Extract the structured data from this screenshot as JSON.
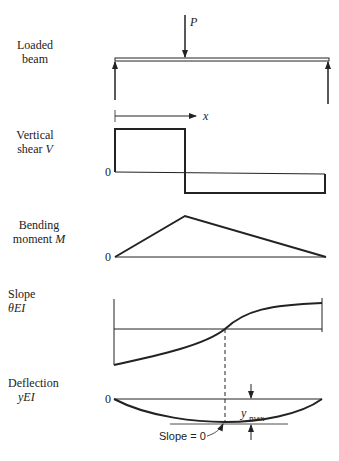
{
  "figure": {
    "panels": [
      {
        "id": "loaded-beam",
        "label_line1": "Loaded",
        "label_line2": "beam",
        "load_label": "P",
        "axis_label": "x"
      },
      {
        "id": "shear",
        "label_line1": "Vertical",
        "label_line2_text": "shear ",
        "label_line2_symbol": "V",
        "zero": "0"
      },
      {
        "id": "moment",
        "label_line1": "Bending",
        "label_line2_text": "moment ",
        "label_line2_symbol": "M",
        "zero": "0"
      },
      {
        "id": "slope",
        "label_line1": "Slope",
        "label_line2_symbol": "θEI"
      },
      {
        "id": "deflection",
        "label_line1": "Deflection",
        "label_line2_symbol": "yEI",
        "zero": "0",
        "ymax_base": "y",
        "ymax_sub": "max",
        "slope_note": "Slope = 0"
      }
    ]
  },
  "colors": {
    "line": "#222222",
    "background": "#ffffff"
  }
}
